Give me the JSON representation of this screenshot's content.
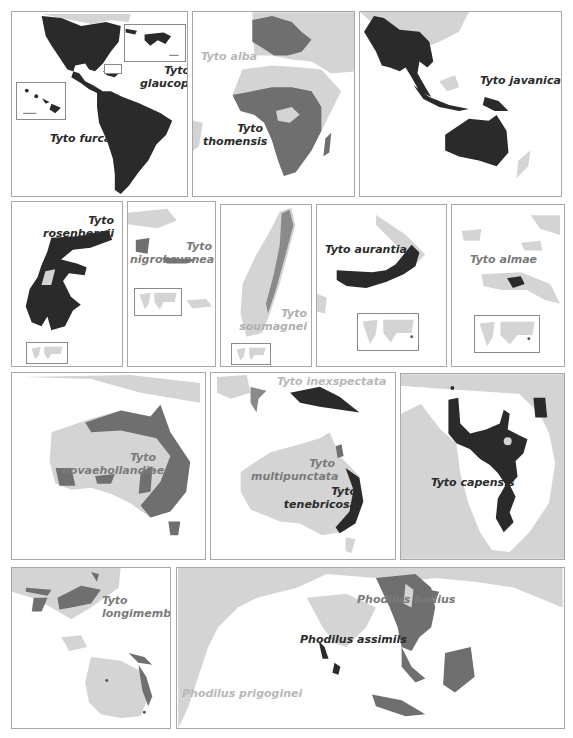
{
  "colors": {
    "range_dark": "#2a2a2a",
    "range_mid": "#6f6f6f",
    "land_light": "#d4d4d4",
    "panel_border": "#a8a8a8",
    "background": "#ffffff"
  },
  "panels": [
    {
      "id": "americas",
      "labels": [
        {
          "text": "Tyto glaucops",
          "tone": "dark"
        },
        {
          "text": "Tyto furcata",
          "tone": "dark"
        }
      ]
    },
    {
      "id": "africa-europe",
      "labels": [
        {
          "text": "Tyto alba",
          "tone": "light"
        },
        {
          "text": "Tyto thomensis",
          "tone": "dark"
        }
      ]
    },
    {
      "id": "asia-australia",
      "labels": [
        {
          "text": "Tyto javanica",
          "tone": "dark"
        }
      ]
    },
    {
      "id": "sulawesi",
      "labels": [
        {
          "text": "Tyto rosenbergii",
          "tone": "dark"
        }
      ]
    },
    {
      "id": "sula-islands",
      "labels": [
        {
          "text": "Tyto nigrobrunnea",
          "tone": "mid"
        }
      ]
    },
    {
      "id": "madagascar",
      "labels": [
        {
          "text": "Tyto soumagnei",
          "tone": "mid"
        }
      ]
    },
    {
      "id": "new-britain",
      "labels": [
        {
          "text": "Tyto aurantia",
          "tone": "dark"
        }
      ]
    },
    {
      "id": "new-guinea-almae",
      "labels": [
        {
          "text": "Tyto almae",
          "tone": "mid"
        }
      ]
    },
    {
      "id": "australia-novaehollandiae",
      "labels": [
        {
          "text": "Tyto novaehollandiae",
          "tone": "mid"
        }
      ]
    },
    {
      "id": "australia-tenebricosa",
      "labels": [
        {
          "text": "Tyto inexspectata",
          "tone": "light"
        },
        {
          "text": "Tyto multipunctata",
          "tone": "mid"
        },
        {
          "text": "Tyto tenebricosa",
          "tone": "dark"
        }
      ]
    },
    {
      "id": "southern-africa",
      "labels": [
        {
          "text": "Tyto capensis",
          "tone": "dark"
        }
      ]
    },
    {
      "id": "asia-longimembris",
      "labels": [
        {
          "text": "Tyto longimembris",
          "tone": "mid"
        }
      ]
    },
    {
      "id": "indian-ocean",
      "labels": [
        {
          "text": "Phodilus badius",
          "tone": "mid"
        },
        {
          "text": "Phodilus assimils",
          "tone": "dark"
        },
        {
          "text": "Phodilus prigoginei",
          "tone": "light"
        }
      ]
    }
  ],
  "text": {
    "glaucops_1": "Tyto",
    "glaucops_2": "glaucops",
    "furcata": "Tyto furcata",
    "alba": "Tyto alba",
    "thomensis_1": "Tyto",
    "thomensis_2": "thomensis",
    "javanica": "Tyto javanica",
    "rosenbergii_1": "Tyto",
    "rosenbergii_2": "rosenbergii",
    "nigrobrunnea_1": "Tyto",
    "nigrobrunnea_2": "nigrobrunnea",
    "soumagnei_1": "Tyto",
    "soumagnei_2": "soumagnei",
    "aurantia": "Tyto aurantia",
    "almae": "Tyto almae",
    "novaehollandiae_1": "Tyto",
    "novaehollandiae_2": "novaehollandiae",
    "inexspectata": "Tyto inexspectata",
    "multipunctata_1": "Tyto",
    "multipunctata_2": "multipunctata",
    "tenebricosa_1": "Tyto",
    "tenebricosa_2": "tenebricosa",
    "capensis": "Tyto capensis",
    "longimembris_1": "Tyto",
    "longimembris_2": "longimembris",
    "badius": "Phodilus badius",
    "assimils": "Phodilus assimils",
    "prigoginei": "Phodilus prigoginei"
  }
}
